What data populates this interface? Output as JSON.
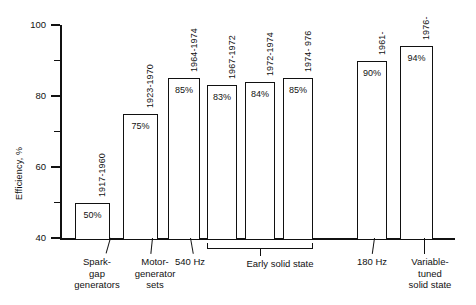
{
  "chart_data": {
    "type": "bar",
    "title": "",
    "xlabel": "",
    "ylabel": "Efficiency, %",
    "ylim": [
      40,
      100
    ],
    "yticks": [
      "40",
      "60",
      "80",
      "100"
    ],
    "yticks_minor": [
      "50",
      "70",
      "90"
    ],
    "grid": false,
    "legend": "none",
    "categories": [
      "1917-1960",
      "1923-1970",
      "1964-1974",
      "1967-1972",
      "1972-1974",
      "1974- 976",
      "1961-",
      "1976-"
    ],
    "values": [
      50,
      75,
      85,
      83,
      84,
      85,
      90,
      94
    ],
    "bars": [
      {
        "year": "1917-1960",
        "value": 50,
        "value_label": "50%"
      },
      {
        "year": "1923-1970",
        "value": 75,
        "value_label": "75%"
      },
      {
        "year": "1964-1974",
        "value": 85,
        "value_label": "85%"
      },
      {
        "year": "1967-1972",
        "value": 83,
        "value_label": "83%"
      },
      {
        "year": "1972-1974",
        "value": 84,
        "value_label": "84%"
      },
      {
        "year": "1974- 976",
        "value": 85,
        "value_label": "85%"
      },
      {
        "year": "1961-",
        "value": 90,
        "value_label": "90%"
      },
      {
        "year": "1976-",
        "value": 94,
        "value_label": "94%"
      }
    ],
    "groups": [
      {
        "label": "Spark-\ngap\ngenerators",
        "bars": [
          0
        ]
      },
      {
        "label": "Motor-\ngenerator\nsets",
        "bars": [
          1
        ]
      },
      {
        "label": "540 Hz",
        "bars": [
          2
        ]
      },
      {
        "label": "Early solid state",
        "bars": [
          3,
          4,
          5
        ]
      },
      {
        "label": "180 Hz",
        "bars": [
          6
        ]
      },
      {
        "label": "Variable-\ntuned\nsolid state",
        "bars": [
          7
        ]
      }
    ],
    "colors": {
      "bar_fill": "#ffffff",
      "bar_stroke": "#111111",
      "axis": "#111111",
      "text": "#111111"
    }
  }
}
